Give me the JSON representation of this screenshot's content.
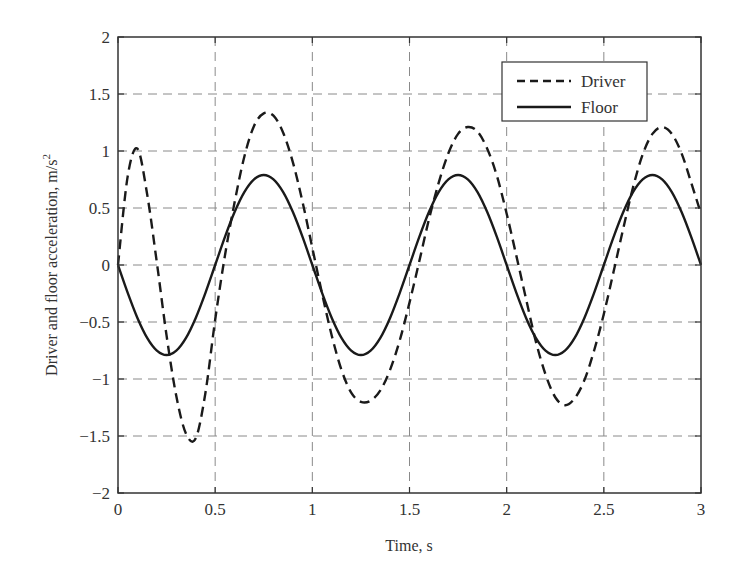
{
  "chart_data": {
    "type": "line",
    "title": "",
    "xlabel": "Time, s",
    "ylabel": "Driver and floor acceleration, m/s",
    "ylabel_superscript": "2",
    "xlim": [
      0,
      3
    ],
    "ylim": [
      -2,
      2
    ],
    "xticks": [
      0,
      0.5,
      1,
      1.5,
      2,
      2.5,
      3
    ],
    "xtick_labels": [
      "0",
      "0.5",
      "1",
      "1.5",
      "2",
      "2.5",
      "3"
    ],
    "yticks": [
      -2,
      -1.5,
      -1,
      -0.5,
      0,
      0.5,
      1,
      1.5,
      2
    ],
    "ytick_labels": [
      "−2",
      "−1.5",
      "−1",
      "−0.5",
      "0",
      "0.5",
      "1",
      "1.5",
      "2"
    ],
    "grid": true,
    "legend_position": "upper right",
    "x": [
      0,
      0.05,
      0.1,
      0.15,
      0.2,
      0.25,
      0.3,
      0.35,
      0.4,
      0.45,
      0.5,
      0.55,
      0.6,
      0.65,
      0.7,
      0.75,
      0.8,
      0.85,
      0.9,
      0.95,
      1.0,
      1.05,
      1.1,
      1.15,
      1.2,
      1.25,
      1.3,
      1.35,
      1.4,
      1.45,
      1.5,
      1.55,
      1.6,
      1.65,
      1.7,
      1.75,
      1.8,
      1.85,
      1.9,
      1.95,
      2.0,
      2.05,
      2.1,
      2.15,
      2.2,
      2.25,
      2.3,
      2.35,
      2.4,
      2.45,
      2.5,
      2.55,
      2.6,
      2.65,
      2.7,
      2.75,
      2.8,
      2.85,
      2.9,
      2.95,
      3.0
    ],
    "series": [
      {
        "name": "Driver",
        "style": "dashed",
        "color": "#1a1a1a",
        "values": [
          0,
          0.78,
          1.02,
          0.62,
          0.02,
          -0.62,
          -1.15,
          -1.48,
          -1.52,
          -1.12,
          -0.48,
          0.08,
          0.55,
          0.95,
          1.22,
          1.33,
          1.31,
          1.16,
          0.9,
          0.55,
          0.15,
          -0.25,
          -0.62,
          -0.92,
          -1.12,
          -1.2,
          -1.19,
          -1.1,
          -0.92,
          -0.66,
          -0.33,
          0.03,
          0.4,
          0.72,
          0.98,
          1.15,
          1.21,
          1.17,
          1.02,
          0.78,
          0.45,
          0.08,
          -0.3,
          -0.67,
          -0.96,
          -1.16,
          -1.23,
          -1.17,
          -1.01,
          -0.75,
          -0.43,
          -0.06,
          0.32,
          0.68,
          0.97,
          1.15,
          1.21,
          1.15,
          0.98,
          0.72,
          0.45
        ]
      },
      {
        "name": "Floor",
        "style": "solid",
        "color": "#1a1a1a",
        "values": [
          0,
          -0.244,
          -0.464,
          -0.639,
          -0.751,
          -0.79,
          -0.751,
          -0.639,
          -0.464,
          -0.244,
          0,
          0.244,
          0.464,
          0.639,
          0.751,
          0.79,
          0.751,
          0.639,
          0.464,
          0.244,
          0,
          -0.244,
          -0.464,
          -0.639,
          -0.751,
          -0.79,
          -0.751,
          -0.639,
          -0.464,
          -0.244,
          0,
          0.244,
          0.464,
          0.639,
          0.751,
          0.79,
          0.751,
          0.639,
          0.464,
          0.244,
          0,
          -0.244,
          -0.464,
          -0.639,
          -0.751,
          -0.79,
          -0.751,
          -0.639,
          -0.464,
          -0.244,
          0,
          0.244,
          0.464,
          0.639,
          0.751,
          0.79,
          0.751,
          0.639,
          0.464,
          0.244,
          0
        ]
      }
    ]
  },
  "legend": {
    "items": [
      {
        "label": "Driver",
        "style": "dashed"
      },
      {
        "label": "Floor",
        "style": "solid"
      }
    ]
  },
  "colors": {
    "axis": "#333333",
    "grid": "#8a8a8a",
    "line": "#1a1a1a",
    "background": "#ffffff"
  }
}
